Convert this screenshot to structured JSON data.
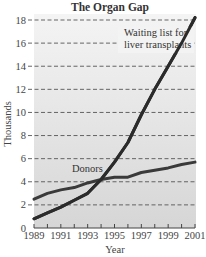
{
  "chart_data": {
    "type": "line",
    "title": "The Organ Gap",
    "xlabel": "Year",
    "ylabel": "Thousands",
    "x": [
      1989,
      1990,
      1991,
      1992,
      1993,
      1994,
      1995,
      1996,
      1997,
      1998,
      1999,
      2000,
      2001
    ],
    "xlim": [
      1989,
      2001
    ],
    "ylim": [
      0,
      18
    ],
    "x_tick_labels": [
      "1989",
      "1991",
      "1993",
      "1995",
      "1997",
      "1999",
      "2001"
    ],
    "x_ticks": [
      1989,
      1991,
      1993,
      1995,
      1997,
      1999,
      2001
    ],
    "x_minor_ticks": [
      1990,
      1992,
      1994,
      1996,
      1998,
      2000
    ],
    "y_tick_labels": [
      "0",
      "2",
      "4",
      "6",
      "8",
      "10",
      "12",
      "14",
      "16",
      "18"
    ],
    "y_ticks": [
      0,
      2,
      4,
      6,
      8,
      10,
      12,
      14,
      16,
      18
    ],
    "grid": true,
    "grid_style": "dashed-horizontal",
    "legend": "none",
    "series": [
      {
        "name": "Waiting list for liver transplants",
        "label_lines": [
          "Waiting list for",
          "liver transplants"
        ],
        "color": "#2b2b2b",
        "values": [
          0.8,
          1.3,
          1.8,
          2.4,
          3.0,
          4.2,
          5.7,
          7.4,
          9.8,
          12.0,
          14.0,
          16.0,
          18.2
        ]
      },
      {
        "name": "Donors",
        "label_lines": [
          "Donors"
        ],
        "color": "#3a3a3a",
        "values": [
          2.5,
          3.0,
          3.3,
          3.5,
          3.9,
          4.2,
          4.4,
          4.4,
          4.8,
          5.0,
          5.2,
          5.5,
          5.7
        ]
      }
    ],
    "colors": {
      "plot_background_top": "#f4f4f4",
      "plot_background_bottom": "#d6d6d6",
      "gridline": "#555555"
    }
  }
}
